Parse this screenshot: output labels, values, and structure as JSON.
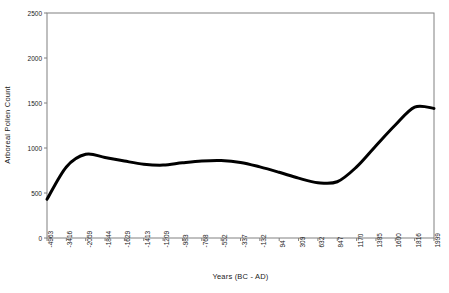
{
  "chart_data": {
    "type": "line",
    "title": "",
    "xlabel": "Years (BC - AD)",
    "ylabel": "Arboreal Pollen Count",
    "ylim": [
      0,
      2500
    ],
    "yticks": [
      0,
      500,
      1000,
      1500,
      2000,
      2500
    ],
    "ytick_labels": [
      "0",
      "500",
      "1000",
      "1500",
      "2000",
      "2500"
    ],
    "grid": false,
    "legend": "none",
    "line_color": "#000000",
    "line_width": 3,
    "categories": [
      "-4963",
      "-3416",
      "-2059",
      "-1844",
      "-1629",
      "-1413",
      "-1209",
      "-983",
      "-768",
      "-552",
      "-337",
      "-132",
      "94",
      "309",
      "632",
      "847",
      "1170",
      "1385",
      "1600",
      "1816",
      "1999"
    ],
    "values": [
      430,
      790,
      930,
      895,
      855,
      820,
      810,
      835,
      855,
      860,
      840,
      790,
      730,
      665,
      615,
      625,
      790,
      1025,
      1255,
      1455,
      1440
    ],
    "series": [
      {
        "name": "Arboreal Pollen Count",
        "values": [
          430,
          790,
          930,
          895,
          855,
          820,
          810,
          835,
          855,
          860,
          840,
          790,
          730,
          665,
          615,
          625,
          790,
          1025,
          1255,
          1455,
          1440
        ]
      }
    ]
  },
  "axes": {
    "frame_color": "#808080",
    "tick_color": "#808080"
  }
}
